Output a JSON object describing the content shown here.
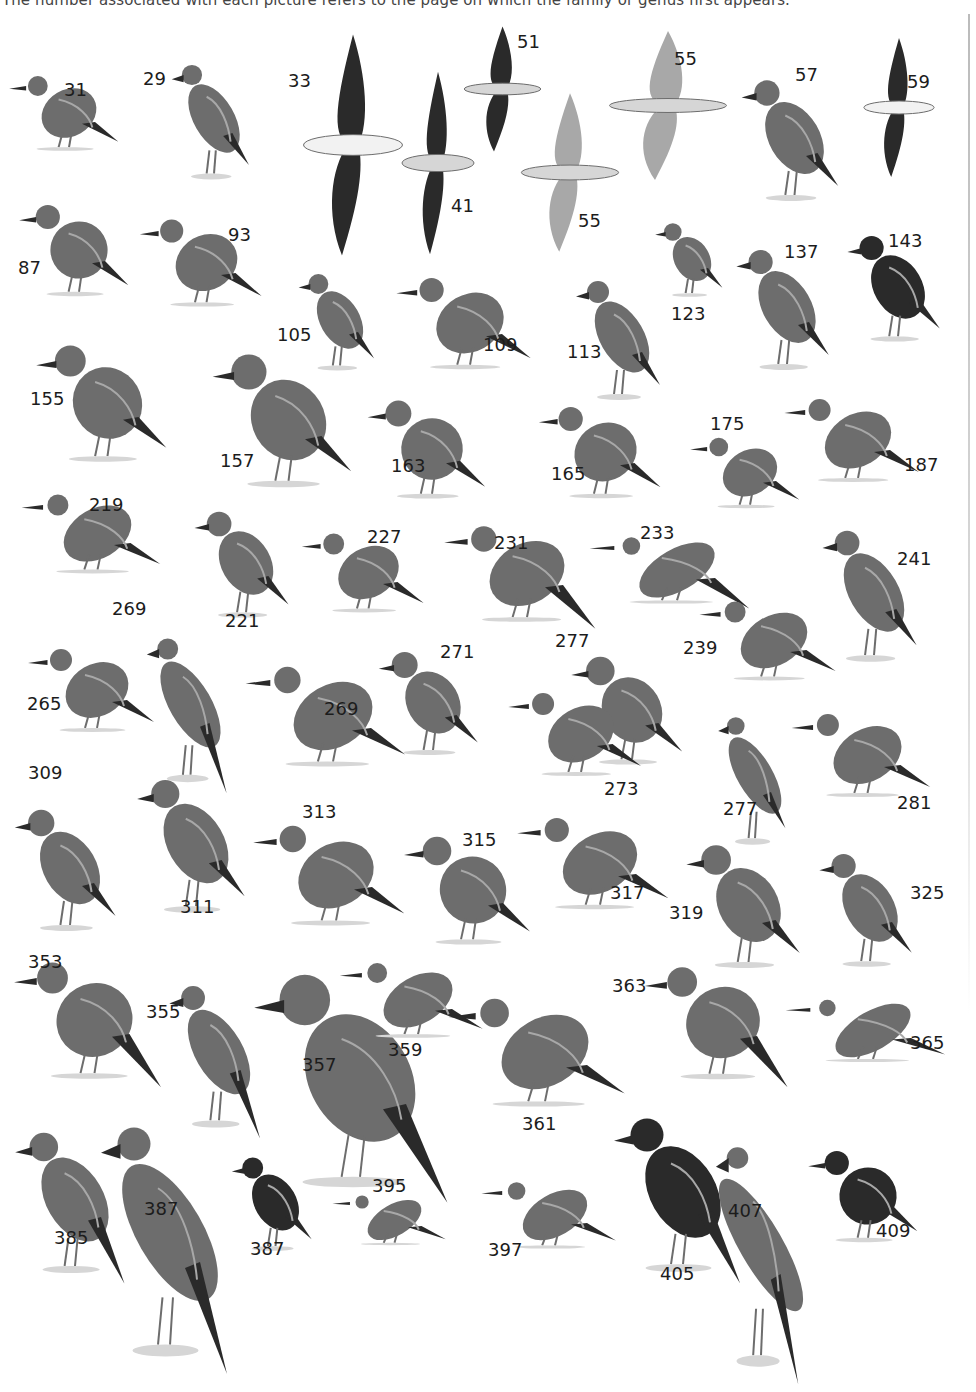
{
  "caption": "The number associated with each picture refers to the page on which the family or genus first appears.",
  "colors": {
    "ink": "#1c1c1c",
    "dark": "#2a2a2a",
    "mid": "#6d6d6d",
    "light": "#a8a8a8",
    "pale": "#d6d6d6"
  },
  "birds": [
    {
      "page": "31",
      "label_x": 64,
      "label_y": 81,
      "kind": "grebe",
      "x": 4,
      "y": 68,
      "w": 130,
      "h": 90
    },
    {
      "page": "29",
      "label_x": 143,
      "label_y": 70,
      "kind": "penguin",
      "x": 168,
      "y": 46,
      "w": 92,
      "h": 145
    },
    {
      "page": "33",
      "label_x": 288,
      "label_y": 72,
      "kind": "albatross-flying",
      "x": 298,
      "y": 30,
      "w": 110,
      "h": 230
    },
    {
      "page": "41",
      "label_x": 451,
      "label_y": 197,
      "kind": "petrel-flying",
      "x": 398,
      "y": 68,
      "w": 80,
      "h": 190
    },
    {
      "page": "51",
      "label_x": 517,
      "label_y": 33,
      "kind": "storm-petrel",
      "x": 460,
      "y": 24,
      "w": 85,
      "h": 130
    },
    {
      "page": "55",
      "label_x": 674,
      "label_y": 50,
      "kind": "tropicbird",
      "x": 603,
      "y": 28,
      "w": 130,
      "h": 155
    },
    {
      "page": "57",
      "label_x": 795,
      "label_y": 66,
      "kind": "cormorant",
      "x": 737,
      "y": 63,
      "w": 115,
      "h": 150
    },
    {
      "page": "59",
      "label_x": 907,
      "label_y": 73,
      "kind": "frigatebird",
      "x": 860,
      "y": 35,
      "w": 78,
      "h": 145
    },
    {
      "page": "55",
      "label_x": 578,
      "label_y": 212,
      "kind": "gannet",
      "x": 516,
      "y": 90,
      "w": 108,
      "h": 165
    },
    {
      "page": "87",
      "label_x": 18,
      "label_y": 259,
      "kind": "vulture",
      "x": 14,
      "y": 195,
      "w": 130,
      "h": 110
    },
    {
      "page": "93",
      "label_x": 228,
      "label_y": 226,
      "kind": "eagle",
      "x": 134,
      "y": 210,
      "w": 145,
      "h": 105
    },
    {
      "page": "105",
      "label_x": 277,
      "label_y": 326,
      "kind": "buzzard",
      "x": 295,
      "y": 260,
      "w": 90,
      "h": 120
    },
    {
      "page": "109",
      "label_x": 483,
      "label_y": 336,
      "kind": "harrier",
      "x": 390,
      "y": 268,
      "w": 160,
      "h": 110
    },
    {
      "page": "113",
      "label_x": 567,
      "label_y": 343,
      "kind": "goshawk",
      "x": 572,
      "y": 262,
      "w": 100,
      "h": 150
    },
    {
      "page": "123",
      "label_x": 671,
      "label_y": 305,
      "kind": "falcon",
      "x": 652,
      "y": 214,
      "w": 80,
      "h": 90
    },
    {
      "page": "137",
      "label_x": 784,
      "label_y": 243,
      "kind": "francolin",
      "x": 732,
      "y": 232,
      "w": 110,
      "h": 150
    },
    {
      "page": "143",
      "label_x": 888,
      "label_y": 232,
      "kind": "guineafowl",
      "x": 843,
      "y": 222,
      "w": 110,
      "h": 130
    },
    {
      "page": "155",
      "label_x": 30,
      "label_y": 390,
      "kind": "crowned-crane",
      "x": 30,
      "y": 333,
      "w": 155,
      "h": 140
    },
    {
      "page": "157",
      "label_x": 220,
      "label_y": 452,
      "kind": "bustard",
      "x": 206,
      "y": 340,
      "w": 165,
      "h": 160
    },
    {
      "page": "163",
      "label_x": 391,
      "label_y": 457,
      "kind": "avocet",
      "x": 362,
      "y": 390,
      "w": 140,
      "h": 118
    },
    {
      "page": "165",
      "label_x": 551,
      "label_y": 465,
      "kind": "plover",
      "x": 533,
      "y": 397,
      "w": 145,
      "h": 110
    },
    {
      "page": "175",
      "label_x": 710,
      "label_y": 415,
      "kind": "sandpiper",
      "x": 685,
      "y": 430,
      "w": 130,
      "h": 85
    },
    {
      "page": "187",
      "label_x": 904,
      "label_y": 456,
      "kind": "snipe",
      "x": 778,
      "y": 390,
      "w": 160,
      "h": 100
    },
    {
      "page": "219",
      "label_x": 89,
      "label_y": 496,
      "kind": "sandgrouse",
      "x": 15,
      "y": 486,
      "w": 165,
      "h": 95
    },
    {
      "page": "221",
      "label_x": 225,
      "label_y": 612,
      "kind": "pigeon",
      "x": 190,
      "y": 498,
      "w": 112,
      "h": 130
    },
    {
      "page": "227",
      "label_x": 367,
      "label_y": 528,
      "kind": "parrot",
      "x": 296,
      "y": 525,
      "w": 145,
      "h": 95
    },
    {
      "page": "231",
      "label_x": 494,
      "label_y": 534,
      "kind": "turaco",
      "x": 437,
      "y": 516,
      "w": 180,
      "h": 115
    },
    {
      "page": "233",
      "label_x": 640,
      "label_y": 524,
      "kind": "cuckoo",
      "x": 582,
      "y": 530,
      "w": 190,
      "h": 80
    },
    {
      "page": "241",
      "label_x": 897,
      "label_y": 550,
      "kind": "owl",
      "x": 818,
      "y": 510,
      "w": 112,
      "h": 165
    },
    {
      "page": "269",
      "label_x": 112,
      "label_y": 600,
      "kind": "wood-hoopoe",
      "x": 143,
      "y": 612,
      "w": 95,
      "h": 185
    },
    {
      "page": "265",
      "label_x": 27,
      "label_y": 695,
      "kind": "hornbill",
      "x": 22,
      "y": 640,
      "w": 150,
      "h": 100
    },
    {
      "page": "269",
      "label_x": 324,
      "label_y": 700,
      "kind": "hoopoe",
      "x": 238,
      "y": 656,
      "w": 190,
      "h": 120
    },
    {
      "page": "271",
      "label_x": 440,
      "label_y": 643,
      "kind": "mousebird",
      "x": 374,
      "y": 640,
      "w": 118,
      "h": 125
    },
    {
      "page": "277",
      "label_x": 555,
      "label_y": 632,
      "kind": "barbet-owlish",
      "x": 566,
      "y": 645,
      "w": 132,
      "h": 130
    },
    {
      "page": "239",
      "label_x": 683,
      "label_y": 639,
      "kind": "coucal",
      "x": 693,
      "y": 593,
      "w": 162,
      "h": 95
    },
    {
      "page": "273",
      "label_x": 604,
      "label_y": 780,
      "kind": "barbet",
      "x": 502,
      "y": 684,
      "w": 158,
      "h": 100
    },
    {
      "page": "277",
      "label_x": 723,
      "label_y": 800,
      "kind": "woodpecker",
      "x": 715,
      "y": 693,
      "w": 80,
      "h": 165
    },
    {
      "page": "281",
      "label_x": 897,
      "label_y": 794,
      "kind": "lark",
      "x": 785,
      "y": 705,
      "w": 165,
      "h": 100
    },
    {
      "page": "309",
      "label_x": 28,
      "label_y": 764,
      "kind": "cuckooshrike",
      "x": 10,
      "y": 793,
      "w": 120,
      "h": 150
    },
    {
      "page": "311",
      "label_x": 180,
      "label_y": 898,
      "kind": "bulbul",
      "x": 132,
      "y": 761,
      "w": 128,
      "h": 165
    },
    {
      "page": "313",
      "label_x": 302,
      "label_y": 803,
      "kind": "thrush-plain",
      "x": 246,
      "y": 815,
      "w": 180,
      "h": 120
    },
    {
      "page": "315",
      "label_x": 462,
      "label_y": 831,
      "kind": "robin-chat",
      "x": 398,
      "y": 825,
      "w": 150,
      "h": 130
    },
    {
      "page": "317",
      "label_x": 610,
      "label_y": 884,
      "kind": "scrub-robin",
      "x": 510,
      "y": 808,
      "w": 180,
      "h": 110
    },
    {
      "page": "319",
      "label_x": 669,
      "label_y": 904,
      "kind": "wheatear",
      "x": 681,
      "y": 830,
      "w": 135,
      "h": 150
    },
    {
      "page": "325",
      "label_x": 910,
      "label_y": 884,
      "kind": "shrike",
      "x": 815,
      "y": 838,
      "w": 110,
      "h": 140
    },
    {
      "page": "353",
      "label_x": 28,
      "label_y": 953,
      "kind": "prinia",
      "x": 7,
      "y": 950,
      "w": 175,
      "h": 140
    },
    {
      "page": "355",
      "label_x": 146,
      "label_y": 1003,
      "kind": "flycatcher",
      "x": 165,
      "y": 962,
      "w": 108,
      "h": 180
    },
    {
      "page": "357",
      "label_x": 302,
      "label_y": 1056,
      "kind": "paradise-flycatcher",
      "x": 245,
      "y": 948,
      "w": 230,
      "h": 260
    },
    {
      "page": "359",
      "label_x": 388,
      "label_y": 1041,
      "kind": "white-eye",
      "x": 333,
      "y": 955,
      "w": 170,
      "h": 90
    },
    {
      "page": "361",
      "label_x": 522,
      "label_y": 1115,
      "kind": "batis-pair",
      "x": 440,
      "y": 987,
      "w": 210,
      "h": 130
    },
    {
      "page": "363",
      "label_x": 612,
      "label_y": 977,
      "kind": "wagtail",
      "x": 638,
      "y": 955,
      "w": 170,
      "h": 135
    },
    {
      "page": "365",
      "label_x": 910,
      "label_y": 1034,
      "kind": "pipit",
      "x": 778,
      "y": 993,
      "w": 190,
      "h": 75
    },
    {
      "page": "385",
      "label_x": 54,
      "label_y": 1229,
      "kind": "oriole",
      "x": 10,
      "y": 1112,
      "w": 130,
      "h": 175
    },
    {
      "page": "387",
      "label_x": 144,
      "label_y": 1200,
      "kind": "sugarbird",
      "x": 95,
      "y": 1085,
      "w": 150,
      "h": 295
    },
    {
      "page": "387",
      "label_x": 250,
      "label_y": 1240,
      "kind": "sunbird",
      "x": 228,
      "y": 1145,
      "w": 95,
      "h": 115
    },
    {
      "page": "395",
      "label_x": 372,
      "label_y": 1177,
      "kind": "sparrow",
      "x": 327,
      "y": 1190,
      "w": 135,
      "h": 60
    },
    {
      "page": "397",
      "label_x": 488,
      "label_y": 1241,
      "kind": "weaver",
      "x": 475,
      "y": 1175,
      "w": 160,
      "h": 80
    },
    {
      "page": "405",
      "label_x": 660,
      "label_y": 1265,
      "kind": "widowbird",
      "x": 608,
      "y": 1097,
      "w": 150,
      "h": 190
    },
    {
      "page": "407",
      "label_x": 728,
      "label_y": 1202,
      "kind": "whydah",
      "x": 712,
      "y": 1100,
      "w": 98,
      "h": 290
    },
    {
      "page": "409",
      "label_x": 876,
      "label_y": 1222,
      "kind": "finch",
      "x": 803,
      "y": 1141,
      "w": 130,
      "h": 110
    }
  ]
}
